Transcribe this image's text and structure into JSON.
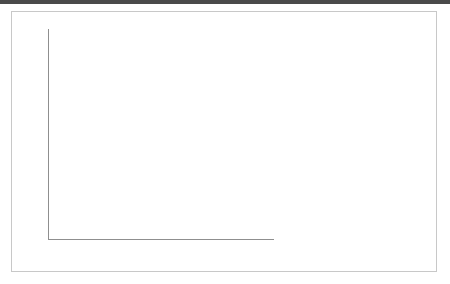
{
  "chart_data": {
    "type": "bar",
    "title": "",
    "subtitle": "",
    "xlabel": "",
    "ylabel": "",
    "ylim": [
      0,
      45
    ],
    "yticks": [
      0,
      5,
      10,
      15,
      20,
      25,
      30,
      35,
      40,
      45
    ],
    "ytick_labels": [
      "0",
      "5",
      "10",
      "15",
      "20",
      "25",
      "30",
      "35",
      "40",
      "45"
    ],
    "grid": true,
    "legend_position": "right",
    "categories": [
      "Rural Youth Study",
      "New Hampshire Youth Study"
    ],
    "series": [
      {
        "name": "Did a close friend or family member die?",
        "color": "#565656",
        "values": [
          41.7,
          30.8
        ]
      },
      {
        "name": "Did you have a very bad accident ot injury?",
        "color": "#b5b5b5",
        "values": [
          25.1,
          18.0
        ]
      },
      {
        "name": "Did someone drink or use drugs so often that it caused problems for your family?",
        "color": "#8c8c8c",
        "values": [
          23.7,
          15.4
        ]
      }
    ]
  },
  "legend": {
    "items": [
      {
        "label": "Did a close friend or family member die?",
        "color": "#565656"
      },
      {
        "label": "Did you have a very bad accident ot injury?",
        "color": "#b5b5b5"
      },
      {
        "label": "Did someone drink or use drugs so often that it caused problems for your family?",
        "color": "#8c8c8c"
      }
    ]
  },
  "colors": {
    "series_1": "#565656",
    "series_2": "#b5b5b5",
    "series_3": "#8c8c8c",
    "gridline": "#b9b9b9",
    "axis": "#8f8f8f",
    "text": "#3d3d3d",
    "panel_border": "#c8c8c8",
    "top_strip": "#4a4a4a",
    "background": "#ffffff"
  }
}
